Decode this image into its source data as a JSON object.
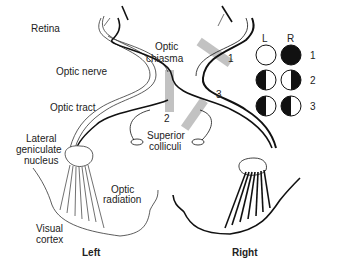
{
  "labels": {
    "retina": "Retina",
    "optic_chiasma_1": "Optic",
    "optic_chiasma_2": "chiasma",
    "optic_nerve": "Optic nerve",
    "optic_tract": "Optic tract",
    "lgn_1": "Lateral",
    "lgn_2": "geniculate",
    "lgn_3": "nucleus",
    "superior_colliculi_1": "Superior",
    "superior_colliculi_2": "colliculi",
    "optic_radiation_1": "Optic",
    "optic_radiation_2": "radiation",
    "visual_cortex_1": "Visual",
    "visual_cortex_2": "cortex",
    "left": "Left",
    "right": "Right"
  },
  "lesions": [
    {
      "id": "1",
      "label": "1",
      "location": "right optic nerve"
    },
    {
      "id": "2",
      "label": "2",
      "location": "optic chiasma (midline)"
    },
    {
      "id": "3",
      "label": "3",
      "location": "right optic tract"
    }
  ],
  "visual_fields": {
    "header_left": "L",
    "header_right": "R",
    "rows": [
      {
        "label": "1",
        "left": "clear",
        "right": "full-black"
      },
      {
        "label": "2",
        "left": "left-half-black",
        "right": "right-half-black"
      },
      {
        "label": "3",
        "left": "left-half-black",
        "right": "left-half-black"
      }
    ]
  },
  "colors": {
    "line": "#111111",
    "lesion_band": "#b0b0b0",
    "background": "#ffffff"
  }
}
